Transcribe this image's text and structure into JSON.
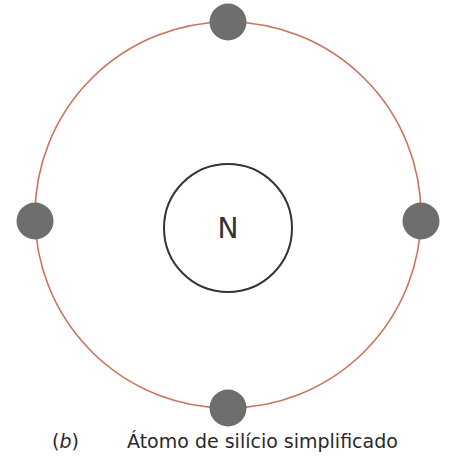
{
  "diagram": {
    "type": "atom-model",
    "nucleus": {
      "label": "N",
      "stroke": "#333333"
    },
    "orbit": {
      "stroke": "#c8745a"
    },
    "electrons": [
      {
        "position": "top",
        "fill": "#6e6e6e"
      },
      {
        "position": "left",
        "fill": "#6e6e6e"
      },
      {
        "position": "right",
        "fill": "#6e6e6e"
      },
      {
        "position": "bottom",
        "fill": "#6e6e6e"
      }
    ],
    "electron_count": 4
  },
  "caption": {
    "open_paren": "(",
    "letter": "b",
    "close_paren": ")",
    "title": "Átomo de silício simplificado"
  }
}
